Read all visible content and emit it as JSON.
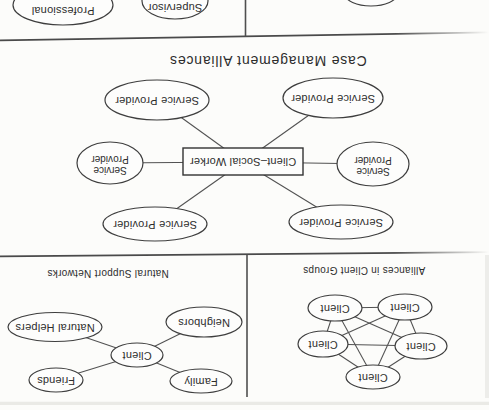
{
  "colors": {
    "paper": "#fcfcfa",
    "ink": "#3e3e3e",
    "text": "#2d2d2d"
  },
  "figure": {
    "main_title": "Case Management Alliances",
    "case_management": {
      "center_box": "Client–Social Worker",
      "service_provider": "Service Provider",
      "service": "Service",
      "provider": "Provider"
    },
    "natural_support": {
      "title": "Natural Support Networks",
      "center": "Client",
      "family": "Family",
      "friends": "Friends",
      "neighbors": "Neighbors",
      "natural_helpers": "Natural Helpers"
    },
    "client_groups": {
      "title": "Alliances in Client Groups",
      "member": "Client"
    },
    "partial_panel": {
      "supervisor": "Supervisor",
      "professional": "Professional"
    }
  }
}
